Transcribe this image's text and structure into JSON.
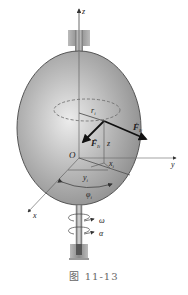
{
  "figure": {
    "caption": "图  11-13",
    "colors": {
      "body_fill": "#a8a8a8",
      "body_highlight": "#e0e0e0",
      "outline": "#444444",
      "axis": "#555555",
      "force": "#222222"
    }
  },
  "labels": {
    "z_axis": "z",
    "y_axis": "y",
    "x_axis": "x",
    "origin": "O",
    "radius": "r",
    "radius_sub": "i",
    "force_tangential": "F",
    "force_tangential_sub": "Ii",
    "force_tangential_sup": "t",
    "force_normal": "F",
    "force_normal_sub": "Ii",
    "force_normal_sup": "n",
    "z_coord": "z",
    "x_coord": "x",
    "x_coord_sub": "i",
    "y_coord": "y",
    "y_coord_sub": "i",
    "angle": "φ",
    "angle_sub": "i",
    "omega": "ω",
    "alpha": "α"
  }
}
